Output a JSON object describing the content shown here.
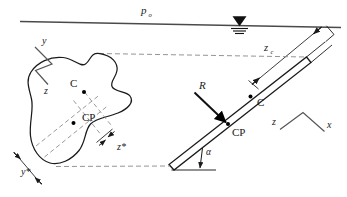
{
  "figure": {
    "name": "hydrostatic-force-inclined-plane",
    "colors": {
      "line": "#1a1a1a",
      "surface_line": "#4a4a4a",
      "dashed": "#777777",
      "label": "#1a1a1a",
      "fill_marker": "#000000",
      "background": "#ffffff"
    }
  },
  "labels": {
    "ambient_pressure": "p",
    "ambient_pressure_sub": "o",
    "centroid_depth": "z",
    "centroid_depth_sub": "c",
    "resultant_force": "R",
    "angle": "α",
    "plate_centroid": "C",
    "plate_center_of_pressure": "CP",
    "plan_centroid": "C",
    "plan_center_of_pressure": "CP",
    "offset_y": "y*",
    "offset_z": "z*",
    "axis_y": "y",
    "axis_z_left": "z",
    "axis_z_right": "z",
    "axis_x": "x"
  },
  "elements": {
    "free_surface_symbol": "free-surface-triangle",
    "water_surface": "free-surface-line",
    "plate": "inclined-submerged-plate",
    "plan_shape": "plane-area-plan-view",
    "projection_lines": "dashed-projection-lines",
    "axis_marker_left": "y-z-axis-marker",
    "axis_marker_right": "z-x-axis-marker"
  }
}
